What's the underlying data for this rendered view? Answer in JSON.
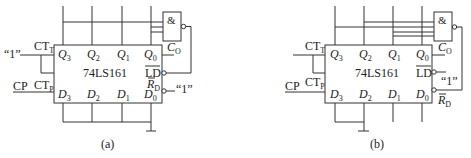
{
  "figure": {
    "panels": [
      {
        "id": "a",
        "caption": "(a)",
        "chip_label": "74LS161",
        "gate_symbol": "&",
        "outputs": [
          {
            "base": "Q",
            "sub": "3"
          },
          {
            "base": "Q",
            "sub": "2"
          },
          {
            "base": "Q",
            "sub": "1"
          },
          {
            "base": "Q",
            "sub": "0"
          }
        ],
        "inputs": [
          {
            "base": "D",
            "sub": "3"
          },
          {
            "base": "D",
            "sub": "2"
          },
          {
            "base": "D",
            "sub": "1"
          },
          {
            "base": "D",
            "sub": "0"
          }
        ],
        "ctt": {
          "base": "CT",
          "sub": "T"
        },
        "ctp": {
          "base": "CT",
          "sub": "P"
        },
        "co": {
          "base": "C",
          "sub": "O"
        },
        "ld": "LD",
        "rd": {
          "base": "R",
          "sub": "D"
        },
        "cp": "CP",
        "one_left": "“1”",
        "one_right": "“1”"
      },
      {
        "id": "b",
        "caption": "(b)",
        "chip_label": "74LS161",
        "gate_symbol": "&",
        "outputs": [
          {
            "base": "Q",
            "sub": "3"
          },
          {
            "base": "Q",
            "sub": "2"
          },
          {
            "base": "Q",
            "sub": "1"
          },
          {
            "base": "Q",
            "sub": "0"
          }
        ],
        "inputs": [
          {
            "base": "D",
            "sub": "3"
          },
          {
            "base": "D",
            "sub": "2"
          },
          {
            "base": "D",
            "sub": "1"
          },
          {
            "base": "D",
            "sub": "0"
          }
        ],
        "ctt": {
          "base": "CT",
          "sub": "T"
        },
        "ctp": {
          "base": "CT",
          "sub": "P"
        },
        "co": {
          "base": "C",
          "sub": "O"
        },
        "ld": "LD",
        "rd": {
          "base": "R",
          "sub": "D"
        },
        "cp": "CP",
        "one_ld": "“1”"
      }
    ]
  }
}
